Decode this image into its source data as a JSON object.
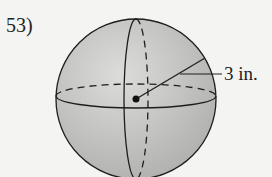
{
  "problem": {
    "number": "53)",
    "figure": "sphere",
    "radius_label": "3 in."
  },
  "colors": {
    "fill": "#c4c4c2",
    "stroke": "#1e1e1e",
    "background": "#f4f4f2"
  }
}
